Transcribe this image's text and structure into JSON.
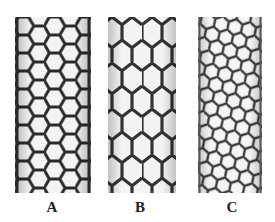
{
  "figure": {
    "panels": [
      {
        "id": "A",
        "label": "A",
        "type": "armchair"
      },
      {
        "id": "B",
        "label": "B",
        "type": "zigzag"
      },
      {
        "id": "C",
        "label": "C",
        "type": "chiral"
      }
    ],
    "colors": {
      "stroke": "#2a2a2a",
      "background": "#ffffff",
      "hex_fill": "#f3f3f3"
    }
  }
}
